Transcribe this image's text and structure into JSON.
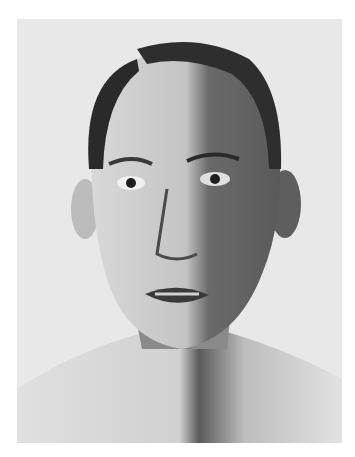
{
  "image": {
    "kind": "black-and-white portrait photograph",
    "subject": "bald-headed man, frontal view, head and bare shoulders",
    "colors": {
      "page": "#ffffff",
      "backdrop": "#e6e6e6",
      "skin_light": "#d9d9d9",
      "skin_mid": "#a8a8a8",
      "shadow": "#4a4a4a",
      "hair": "#2a2a2a"
    }
  }
}
